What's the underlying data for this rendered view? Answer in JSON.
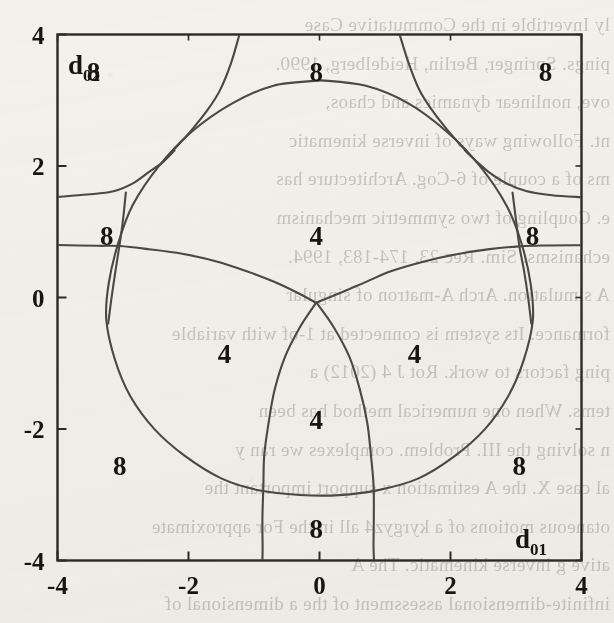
{
  "figure": {
    "kind": "region-plot"
  },
  "axes": {
    "x_name": "d",
    "x_sub": "01",
    "y_name": "d",
    "y_sub": "02",
    "x_ticks": [
      "-4",
      "-2",
      "0",
      "2",
      "4"
    ],
    "y_ticks": [
      "4",
      "2",
      "0",
      "-2",
      "-4"
    ],
    "xlim": [
      -4,
      4
    ],
    "ylim": [
      -4,
      4
    ],
    "frame_color": "#2b2a24",
    "curve_color": "#4a4843"
  },
  "region_labels": [
    {
      "text": "8",
      "x": -3.45,
      "y": 3.45
    },
    {
      "text": "8",
      "x": -0.05,
      "y": 3.45
    },
    {
      "text": "8",
      "x": 3.45,
      "y": 3.45
    },
    {
      "text": "8",
      "x": -3.25,
      "y": 0.95
    },
    {
      "text": "8",
      "x": 3.25,
      "y": 0.95
    },
    {
      "text": "4",
      "x": -0.05,
      "y": 0.95
    },
    {
      "text": "4",
      "x": -1.45,
      "y": -0.85
    },
    {
      "text": "4",
      "x": 1.45,
      "y": -0.85
    },
    {
      "text": "4",
      "x": -0.05,
      "y": -1.85
    },
    {
      "text": "8",
      "x": -3.05,
      "y": -2.55
    },
    {
      "text": "8",
      "x": 3.05,
      "y": -2.55
    },
    {
      "text": "8",
      "x": -0.05,
      "y": -3.5
    }
  ],
  "chart_data": {
    "type": "line",
    "title": "",
    "xlabel": "d01",
    "ylabel": "d02",
    "xlim": [
      -4,
      4
    ],
    "ylim": [
      -4,
      4
    ],
    "xticks": [
      -4,
      -2,
      0,
      2,
      4
    ],
    "yticks": [
      -4,
      -2,
      0,
      2,
      4
    ],
    "grid": false,
    "legend": "none",
    "region_values": [
      4,
      8
    ],
    "series": [
      {
        "name": "outer-squircle",
        "comment": "closed rounded-diamond boundary enclosing the central 4-root regions",
        "points": [
          [
            0.0,
            3.3
          ],
          [
            0.7,
            3.22
          ],
          [
            1.35,
            2.95
          ],
          [
            1.95,
            2.52
          ],
          [
            2.45,
            2.0
          ],
          [
            2.85,
            1.4
          ],
          [
            3.08,
            0.82
          ],
          [
            3.22,
            0.2
          ],
          [
            3.25,
            -0.35
          ],
          [
            3.12,
            -0.95
          ],
          [
            2.88,
            -1.5
          ],
          [
            2.52,
            -2.0
          ],
          [
            2.05,
            -2.42
          ],
          [
            1.5,
            -2.75
          ],
          [
            0.9,
            -2.93
          ],
          [
            0.3,
            -3.0
          ],
          [
            -0.3,
            -3.0
          ],
          [
            -0.9,
            -2.93
          ],
          [
            -1.5,
            -2.75
          ],
          [
            -2.05,
            -2.42
          ],
          [
            -2.52,
            -2.0
          ],
          [
            -2.88,
            -1.5
          ],
          [
            -3.12,
            -0.95
          ],
          [
            -3.25,
            -0.35
          ],
          [
            -3.22,
            0.2
          ],
          [
            -3.08,
            0.82
          ],
          [
            -2.85,
            1.4
          ],
          [
            -2.45,
            2.0
          ],
          [
            -1.95,
            2.52
          ],
          [
            -1.35,
            2.95
          ],
          [
            -0.7,
            3.22
          ],
          [
            0.0,
            3.3
          ]
        ]
      },
      {
        "name": "horizontal-branch-left",
        "comment": "nearly horizontal curve entering left frame edge at d02 ~ 0.78 and dipping to the centre saddle",
        "points": [
          [
            -4.0,
            0.8
          ],
          [
            -3.4,
            0.79
          ],
          [
            -3.05,
            0.78
          ],
          [
            -2.6,
            0.74
          ],
          [
            -2.1,
            0.66
          ],
          [
            -1.6,
            0.55
          ],
          [
            -1.1,
            0.4
          ],
          [
            -0.7,
            0.24
          ],
          [
            -0.35,
            0.08
          ],
          [
            -0.05,
            -0.08
          ]
        ]
      },
      {
        "name": "horizontal-branch-right",
        "comment": "mirror of the left horizontal branch",
        "points": [
          [
            4.0,
            0.8
          ],
          [
            3.4,
            0.79
          ],
          [
            3.05,
            0.78
          ],
          [
            2.6,
            0.74
          ],
          [
            2.1,
            0.66
          ],
          [
            1.6,
            0.55
          ],
          [
            1.1,
            0.4
          ],
          [
            0.7,
            0.24
          ],
          [
            0.35,
            0.08
          ],
          [
            -0.05,
            -0.08
          ]
        ]
      },
      {
        "name": "upper-hyperbola-left",
        "comment": "shallow branch from left frame edge at d02 ~ 1.55 rising to meet the squircle near (-2.2,2.25)",
        "points": [
          [
            -4.0,
            1.53
          ],
          [
            -3.55,
            1.56
          ],
          [
            -3.15,
            1.62
          ],
          [
            -2.85,
            1.74
          ],
          [
            -2.6,
            1.9
          ],
          [
            -2.4,
            2.06
          ],
          [
            -2.22,
            2.24
          ]
        ]
      },
      {
        "name": "upper-hyperbola-right",
        "comment": "mirror of the upper shallow branch",
        "points": [
          [
            4.0,
            1.53
          ],
          [
            3.55,
            1.56
          ],
          [
            3.15,
            1.62
          ],
          [
            2.85,
            1.74
          ],
          [
            2.6,
            1.9
          ],
          [
            2.4,
            2.06
          ],
          [
            2.22,
            2.24
          ]
        ]
      },
      {
        "name": "steep-asymptote-left",
        "comment": "steep branch descending from the top frame edge at d01 ~ -1.25 to tangency near (-2.25,2.2)",
        "points": [
          [
            -1.22,
            4.0
          ],
          [
            -1.36,
            3.55
          ],
          [
            -1.52,
            3.15
          ],
          [
            -1.72,
            2.84
          ],
          [
            -1.95,
            2.55
          ],
          [
            -2.14,
            2.33
          ],
          [
            -2.25,
            2.22
          ]
        ]
      },
      {
        "name": "steep-asymptote-right",
        "comment": "mirror of the steep descending branch",
        "points": [
          [
            1.22,
            4.0
          ],
          [
            1.36,
            3.55
          ],
          [
            1.52,
            3.15
          ],
          [
            1.72,
            2.84
          ],
          [
            1.95,
            2.55
          ],
          [
            2.14,
            2.33
          ],
          [
            2.25,
            2.22
          ]
        ]
      },
      {
        "name": "left-vertical-through-node",
        "comment": "near-vertical curve passing through the left triple node at (-3.05,0.78) and running down to the squircle",
        "points": [
          [
            -2.95,
            1.6
          ],
          [
            -3.0,
            1.15
          ],
          [
            -3.05,
            0.78
          ],
          [
            -3.12,
            0.4
          ],
          [
            -3.18,
            0.0
          ],
          [
            -3.23,
            -0.4
          ]
        ]
      },
      {
        "name": "right-vertical-through-node",
        "comment": "mirror near-vertical curve through the right triple node",
        "points": [
          [
            2.95,
            1.6
          ],
          [
            3.0,
            1.15
          ],
          [
            3.05,
            0.78
          ],
          [
            3.12,
            0.4
          ],
          [
            3.18,
            0.0
          ],
          [
            3.23,
            -0.4
          ]
        ]
      },
      {
        "name": "central-loop-left-side",
        "comment": "left side of the inner U/parabola-like loop opening downward from the centre saddle",
        "points": [
          [
            -0.05,
            -0.08
          ],
          [
            -0.3,
            -0.45
          ],
          [
            -0.52,
            -0.9
          ],
          [
            -0.68,
            -1.4
          ],
          [
            -0.78,
            -1.9
          ],
          [
            -0.84,
            -2.4
          ],
          [
            -0.86,
            -2.86
          ],
          [
            -0.87,
            -3.35
          ],
          [
            -0.87,
            -3.8
          ],
          [
            -0.87,
            -4.0
          ]
        ]
      },
      {
        "name": "central-loop-right-side",
        "comment": "right side of the inner downward-opening loop",
        "points": [
          [
            -0.05,
            -0.08
          ],
          [
            0.22,
            -0.45
          ],
          [
            0.45,
            -0.9
          ],
          [
            0.62,
            -1.4
          ],
          [
            0.73,
            -1.9
          ],
          [
            0.79,
            -2.4
          ],
          [
            0.82,
            -2.86
          ],
          [
            0.83,
            -3.35
          ],
          [
            0.83,
            -3.8
          ],
          [
            0.83,
            -4.0
          ]
        ]
      }
    ],
    "nodes": [
      {
        "name": "left-triple-point",
        "x": -3.05,
        "y": 0.78
      },
      {
        "name": "right-triple-point",
        "x": 3.05,
        "y": 0.78
      },
      {
        "name": "centre-saddle",
        "x": -0.05,
        "y": -0.08
      },
      {
        "name": "upper-left-tangency",
        "x": -2.25,
        "y": 2.22
      },
      {
        "name": "upper-right-tangency",
        "x": 2.25,
        "y": 2.22
      },
      {
        "name": "lower-left-crossing",
        "x": -0.86,
        "y": -2.86
      },
      {
        "name": "lower-right-crossing",
        "x": 0.82,
        "y": -2.86
      }
    ]
  },
  "background_text": {
    "note": "faint mirrored bleed-through of printed text from the reverse side of the scanned page",
    "lines": [
      "ly Invertible in the Commutative Case",
      "pings. Springer, Berlin, Heidelberg, 1990.",
      "ove, nonlinear dynamics and chaos,",
      "nt. Following ways of inverse kinematic",
      "ms of a couple of 6-Cog. Architecture has",
      "e. Coupling of two symmetric mechanism",
      "echanisms. Sim. Rec 23. 174-183, 1994.",
      "A simulation. Arch A-matron of singular",
      "formance. Its system is connected at 1-of with variable",
      "ping factors to work. Rot J 4 (2012) a",
      "tems. When one numerical method has been",
      "n solving the III. Problem. complexes we ran y",
      "al case X. the A estimation x support important the",
      "otaneous motions of a kyrgyz4 all in the For approximate",
      "ative g inverse kinematic. The A",
      "infinite-dimensional assessment of the a dimensional of",
      "a present board of a. The Ader. of 12-199. B.V. Youn",
      "nhave, ISSN 1414, we chose pp. 102-109. Springer-Held",
      "Rob 10 (3) 1-4-7-8. 108-336. 1998.",
      "Spronk. V.6.A. a abstract in solution in particular"
    ]
  }
}
